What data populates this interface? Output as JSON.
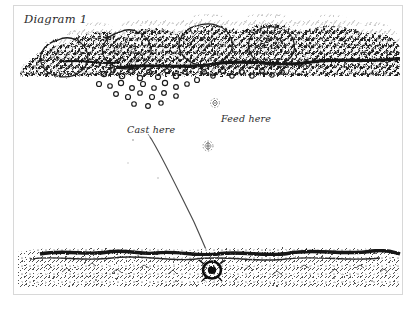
{
  "diagram": {
    "title": "Diagram 1",
    "style": "hand-drawn pen-and-ink sketch",
    "ink_color": "#1a1a1a",
    "paper_color": "#ffffff",
    "frame_color": "#d8d8d8"
  },
  "labels": {
    "title": "Diagram 1",
    "cast_here": "Cast here",
    "feed_here": "Feed here"
  },
  "scene": {
    "canopy_name": "overhanging-tree-canopy",
    "berries_name": "falling-berries",
    "bank_name": "far-bank-shoreline",
    "line_name": "fishing-line",
    "fish_name": "fish-at-line-end",
    "surface_specks_name": "floating-food-specks"
  }
}
